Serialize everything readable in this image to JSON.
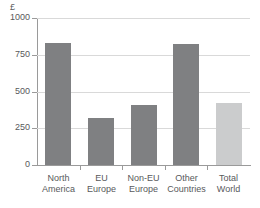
{
  "chart_data": {
    "type": "bar",
    "title": "",
    "subtitle": "",
    "unit_label": "£",
    "xlabel": "",
    "ylabel": "",
    "ylim": [
      0,
      1000
    ],
    "ytick_labels": [
      "1000",
      "750",
      "500",
      "250",
      "0"
    ],
    "ytick_values": [
      1000,
      750,
      500,
      250,
      0
    ],
    "grid": true,
    "legend": "none",
    "categories": [
      "North America",
      "EU Europe",
      "Non-EU Europe",
      "Other Countries",
      "Total World"
    ],
    "category_lines": [
      [
        "North",
        "America"
      ],
      [
        "EU",
        "Europe"
      ],
      [
        "Non-EU",
        "Europe"
      ],
      [
        "Other",
        "Countries"
      ],
      [
        "Total",
        "World"
      ]
    ],
    "values": [
      830,
      320,
      405,
      820,
      425
    ],
    "bar_colors": [
      "#7f8082",
      "#7f8082",
      "#7f8082",
      "#7f8082",
      "#cbcccd"
    ],
    "colors": {
      "bar_dark": "#7f8082",
      "bar_light": "#cbcccd",
      "grid": "#d9d9d9",
      "axis": "#9a9a9a",
      "text": "#58595b",
      "background": "#ffffff"
    }
  }
}
